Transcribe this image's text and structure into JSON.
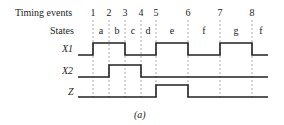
{
  "labels": {
    "timing_events": "Timing events",
    "states": "States",
    "caption": "(a)"
  },
  "events": [
    "1",
    "2",
    "3",
    "4",
    "5",
    "6",
    "7",
    "8"
  ],
  "event_x": [
    93,
    109,
    125,
    141,
    156,
    188,
    220,
    252
  ],
  "states": [
    {
      "label": "a",
      "x": 101
    },
    {
      "label": "b",
      "x": 117
    },
    {
      "label": "c",
      "x": 133
    },
    {
      "label": "d",
      "x": 148
    },
    {
      "label": "e",
      "x": 172
    },
    {
      "label": "f",
      "x": 204
    },
    {
      "label": "g",
      "x": 236
    },
    {
      "label": "f",
      "x": 261
    }
  ],
  "signals": [
    {
      "name": "X1",
      "high_intervals": [
        [
          93,
          125
        ],
        [
          156,
          188
        ],
        [
          220,
          252
        ]
      ]
    },
    {
      "name": "X2",
      "high_intervals": [
        [
          109,
          141
        ]
      ]
    },
    {
      "name": "Z",
      "high_intervals": [
        [
          156,
          188
        ]
      ]
    }
  ],
  "colors": {
    "line": "#222222",
    "dash": "#9a9a9a"
  }
}
